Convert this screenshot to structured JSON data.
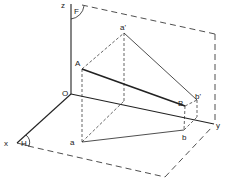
{
  "diagram": {
    "type": "orthographic-projection-line-segment",
    "colors": {
      "line": "#222222",
      "background": "#ffffff"
    },
    "axes": {
      "x_label": "x",
      "y_label": "y",
      "z_label": "z",
      "origin_label": "O"
    },
    "planes": {
      "vertical_label": "F",
      "horizontal_label": "H"
    },
    "points": {
      "A": "A",
      "B": "B",
      "a": "a",
      "b": "b",
      "a_prime": "a'",
      "b_prime": "b'"
    }
  }
}
